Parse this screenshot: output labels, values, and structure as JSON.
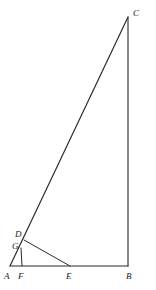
{
  "figure": {
    "canvas": {
      "width": 156,
      "height": 290
    },
    "background_color": "#ffffff",
    "stroke_color": "#2b2b2b",
    "label_color": "#1a1a1a",
    "points": {
      "A": {
        "label": "A",
        "x": 10,
        "y": 266,
        "label_x": 4,
        "label_y": 272
      },
      "B": {
        "label": "B",
        "x": 128,
        "y": 266,
        "label_x": 126,
        "label_y": 272
      },
      "C": {
        "label": "C",
        "x": 128,
        "y": 17,
        "label_x": 133,
        "label_y": 9
      },
      "D": {
        "label": "D",
        "x": 24,
        "y": 240,
        "label_x": 15,
        "label_y": 230
      },
      "E": {
        "label": "E",
        "x": 70,
        "y": 266,
        "label_x": 66,
        "label_y": 272
      },
      "F": {
        "label": "F",
        "x": 22,
        "y": 266,
        "label_x": 18,
        "label_y": 272
      },
      "G": {
        "label": "G",
        "x": 21,
        "y": 248,
        "label_x": 12,
        "label_y": 242
      }
    },
    "segments": [
      {
        "name": "AB",
        "from": "A",
        "to": "B",
        "width": 1.1
      },
      {
        "name": "BC",
        "from": "B",
        "to": "C",
        "width": 1.1
      },
      {
        "name": "AC",
        "from": "A",
        "to": "C",
        "width": 1.2
      },
      {
        "name": "DE",
        "from": "D",
        "to": "E",
        "width": 1.0
      },
      {
        "name": "GF",
        "from": "G",
        "to": "F",
        "width": 1.0
      }
    ]
  }
}
